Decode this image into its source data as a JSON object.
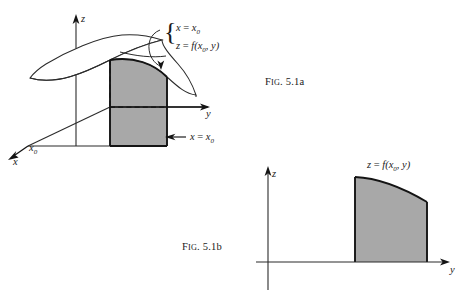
{
  "figure_a": {
    "name": "3d-solid-under-surface",
    "caption": "Fig. 5.1a",
    "caption_head": "F",
    "caption_smallcaps": "IG",
    "caption_tail": ". 5.1a",
    "axes": [
      {
        "name": "x",
        "label": "x",
        "sub": "",
        "tip": [
          10,
          158
        ]
      },
      {
        "name": "y",
        "label": "y",
        "sub": "",
        "tip": [
          208,
          108
        ]
      },
      {
        "name": "z",
        "label": "z",
        "sub": "",
        "tip": [
          76,
          16
        ]
      }
    ],
    "x0_tick_label": "x",
    "x0_tick_sub": "0",
    "brace_line1_lhs": "x",
    "brace_line1_eq": "=",
    "brace_line1_rhs": "x",
    "brace_line1_rhs_sub": "0",
    "brace_line2_lhs": "z",
    "brace_line2_eq": "=",
    "brace_line2_rhs": "f(x",
    "brace_line2_rhs_sub": "0",
    "brace_line2_rhs_tail": ", y)",
    "plane_callout_lhs": "x",
    "plane_callout_eq": "=",
    "plane_callout_rhs": "x",
    "plane_callout_rhs_sub": "0"
  },
  "figure_b": {
    "name": "2d-cross-section",
    "caption": "Fig. 5.1b",
    "caption_head": "F",
    "caption_smallcaps": "IG",
    "caption_tail": ". 5.1b",
    "axes": [
      {
        "name": "z",
        "label": "z",
        "tip": [
          268,
          168
        ]
      },
      {
        "name": "y",
        "label": "y",
        "tip": [
          448,
          262
        ]
      }
    ],
    "curve_label_lhs": "z",
    "curve_label_eq": "=",
    "curve_label_rhs": "f(x",
    "curve_label_rhs_sub": "0",
    "curve_label_rhs_tail": ", y)"
  },
  "colors": {
    "shade_fill": "#a8a8a8",
    "stroke": "#141414",
    "thin_stroke": "#2b2b2b",
    "background": "#ffffff"
  }
}
